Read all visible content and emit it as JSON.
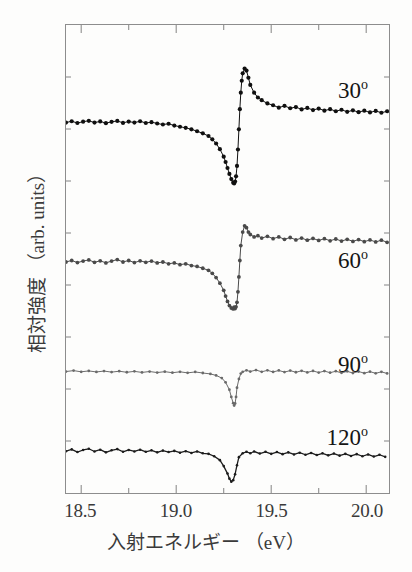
{
  "figure": {
    "background_color": "#fdfdfc",
    "frame_color": "#8d8d8d",
    "text_color": "#3a3a3a"
  },
  "axes": {
    "x_title": "入射エネルギー （eV）",
    "y_title": "相対強度 （arb. units）",
    "x_ticks": [
      {
        "value": 18.5,
        "label": "18.5"
      },
      {
        "value": 19.0,
        "label": "19.0"
      },
      {
        "value": 19.5,
        "label": "19.5"
      },
      {
        "value": 20.0,
        "label": "20.0"
      }
    ],
    "x_minor_ticks": [
      18.75,
      19.25,
      19.75
    ],
    "y_ticks_unlabeled": 8
  },
  "annotations": [
    {
      "name": "label-30",
      "text": "30",
      "degree": "o",
      "x": 368,
      "y": 78
    },
    {
      "name": "label-60",
      "text": "60",
      "degree": "o",
      "x": 368,
      "y": 248
    },
    {
      "name": "label-90",
      "text": "90",
      "degree": "o",
      "x": 368,
      "y": 352
    },
    {
      "name": "label-120",
      "text": "120",
      "degree": "o",
      "x": 368,
      "y": 425
    }
  ],
  "chart_data": {
    "type": "line",
    "title": "",
    "xlabel": "入射エネルギー （eV）",
    "ylabel": "相対強度 （arb. units）",
    "xlim": [
      18.42,
      20.12
    ],
    "ylim": [
      0,
      1
    ],
    "grid": false,
    "legend": "inline-right",
    "marker": "filled-circle",
    "series": [
      {
        "name": "30",
        "label": "30°",
        "color": "#101010",
        "line_width": 1.0,
        "marker_size": 2.1,
        "baseline_y": 122,
        "resonance_energy": 19.32,
        "x": [
          18.42,
          18.45,
          18.48,
          18.51,
          18.54,
          18.57,
          18.6,
          18.63,
          18.66,
          18.69,
          18.72,
          18.75,
          18.78,
          18.81,
          18.84,
          18.87,
          18.9,
          18.93,
          18.96,
          18.99,
          19.02,
          19.05,
          19.08,
          19.11,
          19.14,
          19.17,
          19.19,
          19.21,
          19.23,
          19.25,
          19.26,
          19.27,
          19.28,
          19.29,
          19.3,
          19.305,
          19.31,
          19.315,
          19.32,
          19.325,
          19.33,
          19.335,
          19.34,
          19.345,
          19.35,
          19.36,
          19.37,
          19.38,
          19.39,
          19.41,
          19.43,
          19.45,
          19.48,
          19.51,
          19.54,
          19.57,
          19.6,
          19.63,
          19.66,
          19.69,
          19.72,
          19.75,
          19.78,
          19.81,
          19.84,
          19.87,
          19.9,
          19.93,
          19.96,
          19.99,
          20.02,
          20.05,
          20.08,
          20.11
        ],
        "y": [
          0.5,
          0.509,
          0.497,
          0.506,
          0.512,
          0.5,
          0.508,
          0.496,
          0.505,
          0.511,
          0.498,
          0.507,
          0.5,
          0.509,
          0.497,
          0.503,
          0.494,
          0.487,
          0.492,
          0.48,
          0.472,
          0.465,
          0.455,
          0.442,
          0.428,
          0.41,
          0.388,
          0.36,
          0.322,
          0.272,
          0.236,
          0.196,
          0.156,
          0.122,
          0.098,
          0.092,
          0.105,
          0.14,
          0.21,
          0.32,
          0.455,
          0.59,
          0.7,
          0.78,
          0.83,
          0.862,
          0.848,
          0.8,
          0.752,
          0.7,
          0.668,
          0.65,
          0.628,
          0.616,
          0.6,
          0.612,
          0.596,
          0.604,
          0.588,
          0.598,
          0.584,
          0.594,
          0.58,
          0.59,
          0.576,
          0.586,
          0.572,
          0.582,
          0.57,
          0.58,
          0.568,
          0.578,
          0.566,
          0.576
        ]
      },
      {
        "name": "60",
        "label": "60°",
        "color": "#4a4a4a",
        "line_width": 1.0,
        "marker_size": 1.9,
        "baseline_y": 262,
        "resonance_energy": 19.32,
        "x": [
          18.42,
          18.45,
          18.48,
          18.51,
          18.54,
          18.57,
          18.6,
          18.63,
          18.66,
          18.69,
          18.72,
          18.75,
          18.78,
          18.81,
          18.84,
          18.87,
          18.9,
          18.93,
          18.96,
          18.99,
          19.02,
          19.05,
          19.08,
          19.11,
          19.14,
          19.17,
          19.19,
          19.21,
          19.23,
          19.25,
          19.26,
          19.27,
          19.28,
          19.29,
          19.3,
          19.305,
          19.31,
          19.315,
          19.32,
          19.325,
          19.33,
          19.335,
          19.34,
          19.35,
          19.36,
          19.37,
          19.38,
          19.39,
          19.41,
          19.43,
          19.45,
          19.48,
          19.51,
          19.54,
          19.57,
          19.6,
          19.63,
          19.66,
          19.69,
          19.72,
          19.75,
          19.78,
          19.81,
          19.84,
          19.87,
          19.9,
          19.93,
          19.96,
          19.99,
          20.02,
          20.05,
          20.08,
          20.11
        ],
        "y": [
          0.5,
          0.51,
          0.496,
          0.506,
          0.514,
          0.498,
          0.508,
          0.494,
          0.506,
          0.516,
          0.5,
          0.51,
          0.496,
          0.508,
          0.498,
          0.506,
          0.494,
          0.5,
          0.488,
          0.494,
          0.482,
          0.488,
          0.476,
          0.47,
          0.458,
          0.444,
          0.424,
          0.396,
          0.358,
          0.31,
          0.272,
          0.236,
          0.208,
          0.192,
          0.186,
          0.198,
          0.188,
          0.2,
          0.23,
          0.3,
          0.4,
          0.51,
          0.61,
          0.7,
          0.742,
          0.73,
          0.7,
          0.684,
          0.668,
          0.676,
          0.66,
          0.672,
          0.656,
          0.668,
          0.652,
          0.664,
          0.648,
          0.66,
          0.646,
          0.658,
          0.644,
          0.656,
          0.642,
          0.654,
          0.64,
          0.652,
          0.638,
          0.65,
          0.636,
          0.648,
          0.634,
          0.646,
          0.632
        ]
      },
      {
        "name": "90",
        "label": "90°",
        "color": "#6a6a6a",
        "line_width": 1.0,
        "marker_size": 1.4,
        "baseline_y": 372,
        "resonance_energy": 19.31,
        "x": [
          18.42,
          18.46,
          18.5,
          18.54,
          18.58,
          18.62,
          18.66,
          18.7,
          18.74,
          18.78,
          18.82,
          18.86,
          18.9,
          18.94,
          18.98,
          19.02,
          19.06,
          19.1,
          19.14,
          19.18,
          19.21,
          19.24,
          19.26,
          19.28,
          19.29,
          19.3,
          19.305,
          19.31,
          19.315,
          19.32,
          19.33,
          19.34,
          19.35,
          19.37,
          19.39,
          19.42,
          19.45,
          19.48,
          19.51,
          19.54,
          19.57,
          19.6,
          19.63,
          19.66,
          19.69,
          19.72,
          19.75,
          19.78,
          19.81,
          19.84,
          19.87,
          19.9,
          19.93,
          19.96,
          19.99,
          20.02,
          20.05,
          20.08,
          20.11
        ],
        "y": [
          0.5,
          0.506,
          0.498,
          0.504,
          0.497,
          0.503,
          0.496,
          0.502,
          0.495,
          0.501,
          0.494,
          0.5,
          0.493,
          0.499,
          0.492,
          0.498,
          0.491,
          0.497,
          0.49,
          0.484,
          0.474,
          0.456,
          0.428,
          0.378,
          0.33,
          0.288,
          0.272,
          0.286,
          0.33,
          0.392,
          0.45,
          0.486,
          0.498,
          0.508,
          0.5,
          0.51,
          0.498,
          0.508,
          0.497,
          0.507,
          0.496,
          0.506,
          0.495,
          0.505,
          0.494,
          0.504,
          0.493,
          0.503,
          0.492,
          0.502,
          0.491,
          0.501,
          0.49,
          0.5,
          0.489,
          0.499,
          0.488,
          0.498,
          0.487
        ]
      },
      {
        "name": "120",
        "label": "120°",
        "color": "#1c1c1c",
        "line_width": 1.3,
        "marker_size": 1.3,
        "baseline_y": 452,
        "resonance_energy": 19.3,
        "x": [
          18.42,
          18.45,
          18.48,
          18.51,
          18.54,
          18.57,
          18.6,
          18.63,
          18.66,
          18.69,
          18.72,
          18.75,
          18.78,
          18.81,
          18.84,
          18.87,
          18.9,
          18.93,
          18.96,
          18.99,
          19.02,
          19.05,
          19.08,
          19.11,
          19.14,
          19.17,
          19.2,
          19.23,
          19.25,
          19.27,
          19.28,
          19.29,
          19.3,
          19.31,
          19.32,
          19.33,
          19.35,
          19.37,
          19.39,
          19.41,
          19.44,
          19.47,
          19.5,
          19.53,
          19.56,
          19.59,
          19.62,
          19.65,
          19.68,
          19.71,
          19.74,
          19.77,
          19.8,
          19.83,
          19.86,
          19.89,
          19.92,
          19.95,
          19.98,
          20.01,
          20.04,
          20.07,
          20.1
        ],
        "y": [
          0.5,
          0.512,
          0.494,
          0.508,
          0.516,
          0.498,
          0.51,
          0.492,
          0.506,
          0.514,
          0.496,
          0.508,
          0.498,
          0.51,
          0.496,
          0.506,
          0.492,
          0.504,
          0.494,
          0.502,
          0.49,
          0.5,
          0.488,
          0.498,
          0.486,
          0.482,
          0.466,
          0.44,
          0.4,
          0.35,
          0.316,
          0.296,
          0.306,
          0.346,
          0.406,
          0.46,
          0.486,
          0.496,
          0.486,
          0.498,
          0.484,
          0.496,
          0.482,
          0.494,
          0.48,
          0.492,
          0.478,
          0.49,
          0.476,
          0.488,
          0.474,
          0.486,
          0.472,
          0.484,
          0.47,
          0.482,
          0.468,
          0.48,
          0.466,
          0.478,
          0.464,
          0.476,
          0.462
        ]
      }
    ]
  }
}
